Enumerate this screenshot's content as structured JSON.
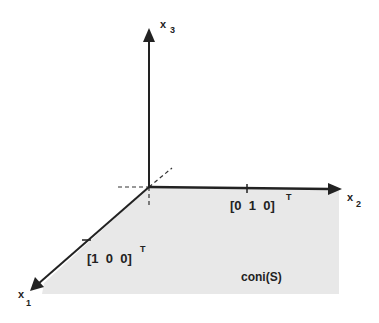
{
  "diagram": {
    "type": "3d-coordinate-axes-cone",
    "colors": {
      "axis": "#222222",
      "region_fill": "#e8e8e8",
      "background": "#ffffff"
    },
    "axes": {
      "x1": {
        "name": "x",
        "subscript": "1"
      },
      "x2": {
        "name": "x",
        "subscript": "2"
      },
      "x3": {
        "name": "x",
        "subscript": "3"
      }
    },
    "vectors": {
      "e1": {
        "label": "[1  0  0]",
        "superscript": "T"
      },
      "e2": {
        "label": "[0  1  0]",
        "superscript": "T"
      }
    },
    "region": {
      "label": "coni(S)"
    }
  }
}
